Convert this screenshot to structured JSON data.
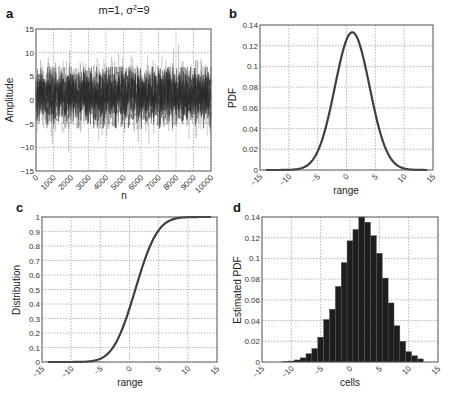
{
  "figure": {
    "colors": {
      "curve": "#3f3f3f",
      "noise_dark": "#2a2a2a",
      "noise_light": "#8a8a8a",
      "bar": "#1e1e1e",
      "grid": "#888888",
      "frame": "#555555"
    }
  },
  "chart_data": [
    {
      "id": "a",
      "panel_label": "a",
      "type": "line",
      "title": "m=1, σ²=9",
      "title_parts": {
        "pre": "m=1, σ",
        "sup": "2",
        "post": "=9"
      },
      "xlabel": "n",
      "ylabel": "Amplitude",
      "xlim": [
        0,
        10000
      ],
      "ylim": [
        -15,
        15
      ],
      "xticks": [
        0,
        1000,
        2000,
        3000,
        4000,
        5000,
        6000,
        7000,
        8000,
        9000,
        10000
      ],
      "yticks": [
        -15,
        -10,
        -5,
        0,
        5,
        10,
        15
      ],
      "grid": true,
      "description": "Gaussian white noise, 10000 samples, mean 1, variance 9; values mostly within -5..7, extremes near -10 and 12",
      "series": [
        {
          "name": "noise",
          "mean": 1,
          "variance": 9,
          "n_samples": 10000
        }
      ],
      "box": {
        "x0": 36,
        "y0": 29,
        "x1": 211,
        "y1": 171
      }
    },
    {
      "id": "b",
      "panel_label": "b",
      "type": "line",
      "title": "",
      "xlabel": "range",
      "ylabel": "PDF",
      "xlim": [
        -15,
        15
      ],
      "ylim": [
        0,
        0.14
      ],
      "xticks": [
        -15,
        -10,
        -5,
        0,
        5,
        10,
        15
      ],
      "yticks": [
        0,
        0.02,
        0.04,
        0.06,
        0.08,
        0.1,
        0.12,
        0.14
      ],
      "grid": true,
      "series": [
        {
          "name": "Gaussian PDF (m=1, σ=3)",
          "x": [
            -14,
            -12,
            -10,
            -8,
            -6,
            -5,
            -4,
            -3,
            -2,
            -1,
            0,
            1,
            2,
            3,
            4,
            5,
            6,
            7,
            8,
            10,
            12,
            14
          ],
          "y": [
            0.0,
            0.0,
            0.0004,
            0.0015,
            0.0087,
            0.018,
            0.0332,
            0.0547,
            0.0807,
            0.1065,
            0.1258,
            0.133,
            0.1258,
            0.1065,
            0.0807,
            0.0547,
            0.0332,
            0.018,
            0.0087,
            0.0015,
            0.0002,
            0.0
          ]
        }
      ],
      "box": {
        "x0": 260,
        "y0": 25,
        "x1": 433,
        "y1": 170
      }
    },
    {
      "id": "c",
      "panel_label": "c",
      "type": "line",
      "title": "",
      "xlabel": "range",
      "ylabel": "Distribution",
      "xlim": [
        -15,
        15
      ],
      "ylim": [
        0,
        1
      ],
      "xticks": [
        -15,
        -10,
        -5,
        0,
        5,
        10,
        15
      ],
      "yticks": [
        0,
        0.1,
        0.2,
        0.3,
        0.4,
        0.5,
        0.6,
        0.7,
        0.8,
        0.9,
        1
      ],
      "grid": true,
      "series": [
        {
          "name": "Gaussian CDF (m=1, σ=3)",
          "x": [
            -14,
            -10,
            -8,
            -6,
            -5,
            -4,
            -3,
            -2,
            -1,
            0,
            1,
            2,
            3,
            4,
            5,
            6,
            7,
            8,
            10,
            14
          ],
          "y": [
            0.0,
            0.0001,
            0.0013,
            0.0098,
            0.0228,
            0.0478,
            0.0912,
            0.1587,
            0.2525,
            0.3694,
            0.5,
            0.6306,
            0.7475,
            0.8413,
            0.9088,
            0.9522,
            0.9772,
            0.9902,
            0.9987,
            1.0
          ]
        }
      ],
      "box": {
        "x0": 42,
        "y0": 217,
        "x1": 217,
        "y1": 362
      }
    },
    {
      "id": "d",
      "panel_label": "d",
      "type": "bar",
      "title": "",
      "xlabel": "cells",
      "ylabel": "Estimated PDF",
      "xlim": [
        -15,
        15
      ],
      "ylim": [
        0,
        0.14
      ],
      "xticks": [
        -15,
        -10,
        -5,
        0,
        5,
        10,
        15
      ],
      "yticks": [
        0,
        0.02,
        0.04,
        0.06,
        0.08,
        0.1,
        0.12,
        0.14
      ],
      "grid": true,
      "categories": [
        -11,
        -10,
        -9,
        -8,
        -7,
        -6,
        -5,
        -4,
        -3,
        -2,
        -1,
        0,
        1,
        2,
        3,
        4,
        5,
        6,
        7,
        8,
        9,
        10,
        11,
        12
      ],
      "values": [
        0.0005,
        0.001,
        0.002,
        0.004,
        0.008,
        0.013,
        0.024,
        0.041,
        0.051,
        0.073,
        0.096,
        0.117,
        0.128,
        0.14,
        0.135,
        0.122,
        0.105,
        0.081,
        0.057,
        0.035,
        0.02,
        0.01,
        0.006,
        0.003
      ],
      "value_note": "bar centers shifted so peak near x≈0..1; bars width 1",
      "box": {
        "x0": 262,
        "y0": 217,
        "x1": 438,
        "y1": 362
      }
    }
  ]
}
